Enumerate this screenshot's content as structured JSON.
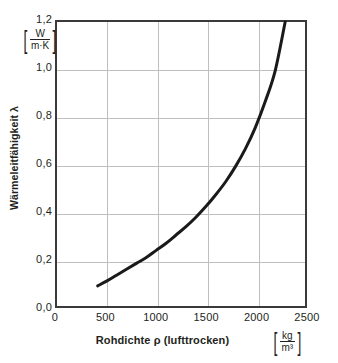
{
  "chart_data": {
    "type": "line",
    "title": "",
    "xlabel": "Rohdichte ρ (lufttrocken)",
    "ylabel": "Wärmeleitfähigkeit λ",
    "xunit_num": "kg",
    "xunit_den": "m³",
    "yunit_num": "W",
    "yunit_den": "m·K",
    "xlim": [
      0,
      2500
    ],
    "ylim": [
      0.0,
      1.2
    ],
    "grid": true,
    "legend": "none",
    "xticks": [
      "0",
      "500",
      "1000",
      "1500",
      "2000",
      "2500"
    ],
    "xtick_values": [
      0,
      500,
      1000,
      1500,
      2000,
      2500
    ],
    "yticks": [
      "0,0",
      "0,2",
      "0,4",
      "0,6",
      "0,8",
      "1,0",
      "1,2"
    ],
    "ytick_values": [
      0.0,
      0.2,
      0.4,
      0.6,
      0.8,
      1.0,
      1.2
    ],
    "series": [
      {
        "name": "Wärmeleitfähigkeit λ",
        "color": "#1a1a1a",
        "x": [
          410,
          500,
          600,
          700,
          800,
          900,
          1000,
          1100,
          1200,
          1300,
          1400,
          1500,
          1600,
          1700,
          1800,
          1900,
          2000,
          2100,
          2200,
          2300
        ],
        "y": [
          0.085,
          0.105,
          0.13,
          0.155,
          0.18,
          0.205,
          0.235,
          0.265,
          0.3,
          0.335,
          0.375,
          0.42,
          0.47,
          0.525,
          0.59,
          0.665,
          0.755,
          0.865,
          0.995,
          1.2
        ]
      }
    ]
  },
  "bracket_char_open": "[",
  "bracket_char_close": "]"
}
